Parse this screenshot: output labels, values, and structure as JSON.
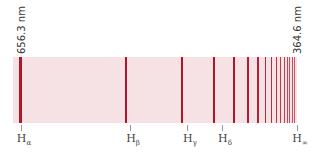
{
  "wavelength_labels": {
    "left": "656.3 nm",
    "right": "364.6 nm"
  },
  "lines": [
    {
      "name": "H",
      "sub": "α",
      "x": 20,
      "w": 3
    },
    {
      "name": "H",
      "sub": "β",
      "x": 126,
      "w": 2.5
    },
    {
      "name": "H",
      "sub": "γ",
      "x": 182,
      "w": 2
    },
    {
      "name": "H",
      "sub": "δ",
      "x": 214,
      "w": 2
    },
    {
      "name": "",
      "sub": "",
      "x": 234,
      "w": 1.5
    },
    {
      "name": "",
      "sub": "",
      "x": 248,
      "w": 1.2
    },
    {
      "name": "",
      "sub": "",
      "x": 258,
      "w": 1.2
    },
    {
      "name": "",
      "sub": "",
      "x": 265,
      "w": 1
    },
    {
      "name": "",
      "sub": "",
      "x": 271,
      "w": 1
    },
    {
      "name": "",
      "sub": "",
      "x": 276,
      "w": 1
    },
    {
      "name": "",
      "sub": "",
      "x": 280,
      "w": 1
    },
    {
      "name": "",
      "sub": "",
      "x": 284,
      "w": 1
    },
    {
      "name": "",
      "sub": "",
      "x": 287,
      "w": 1
    },
    {
      "name": "",
      "sub": "",
      "x": 289.5,
      "w": 1
    },
    {
      "name": "",
      "sub": "",
      "x": 292,
      "w": 1
    },
    {
      "name": "",
      "sub": "",
      "x": 294,
      "w": 1
    }
  ],
  "labels": [
    {
      "base": "H",
      "sub": "α",
      "x": 21
    },
    {
      "base": "H",
      "sub": "β",
      "x": 130
    },
    {
      "base": "H",
      "sub": "γ",
      "x": 187
    },
    {
      "base": "H",
      "sub": "δ",
      "x": 222
    },
    {
      "base": "H",
      "sub": "∞",
      "x": 297
    }
  ],
  "colors": {
    "band": "#f6e2e4",
    "line": "#b0152a"
  }
}
